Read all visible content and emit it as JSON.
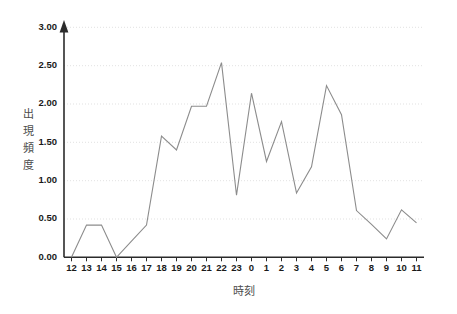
{
  "chart_data": {
    "type": "line",
    "title": "",
    "subtitle": "",
    "xlabel": "時刻",
    "ylabel": "出現頻度",
    "ylabel_chars": [
      "出",
      "現",
      "頻",
      "度"
    ],
    "categories": [
      "12",
      "13",
      "14",
      "15",
      "16",
      "17",
      "18",
      "19",
      "20",
      "21",
      "22",
      "23",
      "0",
      "1",
      "2",
      "3",
      "4",
      "5",
      "6",
      "7",
      "8",
      "9",
      "10",
      "11"
    ],
    "values": [
      0.0,
      0.42,
      0.42,
      0.0,
      0.21,
      0.42,
      1.58,
      1.4,
      1.97,
      1.97,
      2.54,
      0.81,
      2.14,
      1.25,
      1.77,
      0.84,
      1.18,
      2.24,
      1.86,
      0.61,
      0.43,
      0.24,
      0.62,
      0.45
    ],
    "ylim": [
      0,
      3.0
    ],
    "ytick_values": [
      0.0,
      0.5,
      1.0,
      1.5,
      2.0,
      2.5,
      3.0
    ],
    "ytick_labels": [
      "0.00",
      "0.50",
      "1.00",
      "1.50",
      "2.00",
      "2.50",
      "3.00"
    ],
    "grid": true,
    "grid_axis": "y",
    "legend": false,
    "legend_position": "none",
    "series": [
      {
        "name": "出現頻度",
        "color": "#8c8c8c",
        "values": [
          0.0,
          0.42,
          0.42,
          0.0,
          0.21,
          0.42,
          1.58,
          1.4,
          1.97,
          1.97,
          2.54,
          0.81,
          2.14,
          1.25,
          1.77,
          0.84,
          1.18,
          2.24,
          1.86,
          0.61,
          0.43,
          0.24,
          0.62,
          0.45
        ]
      }
    ],
    "annotations": []
  },
  "colors": {
    "background": "#ffffff",
    "line": "#8c8c8c",
    "axis": "#2b2b2b",
    "grid": "#d9d9d9",
    "tick_text": "#1a1a1a",
    "axis_title": "#4d4d4d"
  }
}
